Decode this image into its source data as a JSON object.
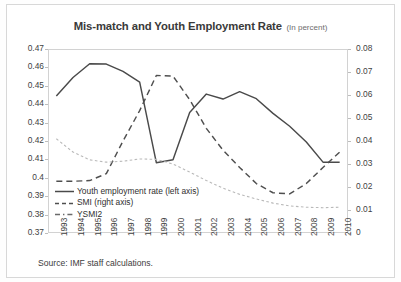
{
  "figure": {
    "title": "Mis-match and Youth Employment Rate",
    "subtitle": "(In percent)",
    "source": "Source: IMF staff calculations."
  },
  "chart_data": {
    "type": "line",
    "title": "Mis-match and Youth Employment Rate (In percent)",
    "xlabel": "",
    "ylabel": "",
    "grid": false,
    "legend_position": "inside-bottom-left",
    "categories": [
      "1993",
      "1994",
      "1995",
      "1996",
      "1997",
      "1998",
      "1999",
      "2000",
      "2001",
      "2002",
      "2003",
      "2004",
      "2005",
      "2006",
      "2007",
      "2008",
      "2009",
      "2010"
    ],
    "y_left_label": "Youth employment rate (left axis)",
    "y_right_label": "SMI / YSMI2 (right axis)",
    "ylim_left": [
      0.37,
      0.47
    ],
    "ylim_right": [
      0.0,
      0.08
    ],
    "yticks_left": [
      "0.47",
      "0.46",
      "0.45",
      "0.44",
      "0.43",
      "0.42",
      "0.41",
      "0.4",
      "0.39",
      "0.38",
      "0.37"
    ],
    "yticks_right": [
      "0.08",
      "0.07",
      "0.06",
      "0.05",
      "0.04",
      "0.03",
      "0.02",
      "0.01",
      "0"
    ],
    "series": [
      {
        "name": "Youth employment rate (left axis)",
        "axis": "left",
        "style": "solid",
        "color": "#4a4a4a",
        "values": [
          0.4445,
          0.4545,
          0.462,
          0.4618,
          0.4578,
          0.452,
          0.4082,
          0.4098,
          0.4355,
          0.4455,
          0.4428,
          0.4468,
          0.443,
          0.435,
          0.428,
          0.4195,
          0.4085,
          0.4085
        ]
      },
      {
        "name": "SMI (right axis)",
        "axis": "right",
        "style": "dashed",
        "color": "#4f4f4f",
        "values": [
          0.0225,
          0.0225,
          0.0228,
          0.0258,
          0.04,
          0.0532,
          0.0685,
          0.0682,
          0.058,
          0.0455,
          0.036,
          0.0285,
          0.0215,
          0.0175,
          0.017,
          0.0215,
          0.0285,
          0.0352
        ]
      },
      {
        "name": "YSMI2",
        "axis": "right",
        "style": "dotted",
        "color": "#b9b9b9",
        "values": [
          0.041,
          0.0352,
          0.0318,
          0.0308,
          0.0312,
          0.0322,
          0.032,
          0.03,
          0.0265,
          0.0228,
          0.0195,
          0.0168,
          0.0148,
          0.013,
          0.0118,
          0.0112,
          0.011,
          0.0112
        ]
      }
    ]
  },
  "legend": {
    "items": [
      {
        "label": "Youth employment rate (left axis)",
        "style": "solid",
        "color": "#4a4a4a"
      },
      {
        "label": "SMI (right axis)",
        "style": "dashed",
        "color": "#4f4f4f"
      },
      {
        "label": "YSMI2",
        "style": "dashdot",
        "color": "#6a6a6a"
      }
    ]
  }
}
